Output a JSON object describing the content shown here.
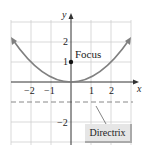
{
  "diagram": {
    "type": "parabola-graph",
    "equation_description": "parabola with vertex at origin, focus (0,1), directrix y=-1",
    "axes": {
      "x_label": "x",
      "y_label": "y"
    },
    "x_ticks": [
      "−2",
      "−1",
      "1",
      "2"
    ],
    "y_ticks": [
      "2",
      "1",
      "−2"
    ],
    "focus": {
      "label": "Focus",
      "x": 0,
      "y": 1
    },
    "directrix": {
      "label": "Directrix",
      "y": -1
    },
    "colors": {
      "curve": "#808080",
      "grid": "#cccccc",
      "directrix_box": "#e6e6e6"
    }
  }
}
